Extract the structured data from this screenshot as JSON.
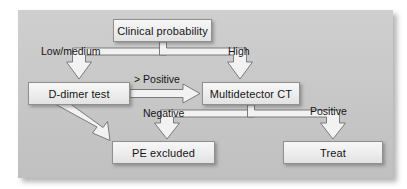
{
  "figure": {
    "kind": "clinical-decision-flowchart",
    "panel_background": "#c6c6c6",
    "node_fill": "#eeeeee",
    "node_border": "#8f8f8f",
    "arrow_fill": "#f2f2f2",
    "arrow_border": "#6f6f6f",
    "text_color": "#151515"
  },
  "nodes": {
    "clinical": "Clinical probability",
    "ddimer": "D-dimer test",
    "ct": "Multidetector CT",
    "pe_excluded": "PE excluded",
    "treat": "Treat"
  },
  "edge_labels": {
    "low_medium": "Low/medium",
    "high": "High",
    "gt_positive": "> Positive",
    "negative": "Negative",
    "positive": "Positive"
  },
  "edges": [
    {
      "from": "clinical",
      "to": "ddimer",
      "label": "Low/medium"
    },
    {
      "from": "clinical",
      "to": "ct",
      "label": "High"
    },
    {
      "from": "ddimer",
      "to": "ct",
      "label": "> Positive"
    },
    {
      "from": "ddimer",
      "to": "pe_excluded",
      "label": ""
    },
    {
      "from": "ct",
      "to": "pe_excluded",
      "label": "Negative"
    },
    {
      "from": "ct",
      "to": "treat",
      "label": "Positive"
    }
  ]
}
